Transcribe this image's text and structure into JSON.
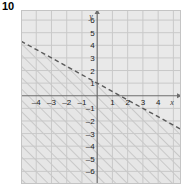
{
  "problem": {
    "number": "10"
  },
  "chart_data": {
    "type": "line",
    "title": "",
    "subtitle": "",
    "xlabel": "x",
    "ylabel": "y",
    "xlim": [
      -5,
      5.5
    ],
    "ylim": [
      -7,
      6.8
    ],
    "grid": true,
    "legend": null,
    "x_ticks": [
      -4,
      -3,
      -2,
      -1,
      1,
      2,
      3,
      4
    ],
    "y_ticks": [
      6,
      5,
      4,
      3,
      2,
      1,
      -1,
      -2,
      -3,
      -4,
      -5,
      -6
    ],
    "x_tick_labels": [
      "–4",
      "–3",
      "–2",
      "–1",
      "1",
      "2",
      "3",
      "4"
    ],
    "y_tick_labels": [
      "6",
      "5",
      "4",
      "3",
      "2",
      "1",
      "–1",
      "–2",
      "–3",
      "–4",
      "–5",
      "–6"
    ],
    "boundary_line": {
      "style": "dashed",
      "slope": -0.6666667,
      "intercept": 1,
      "y_intercept_point": [
        0,
        1
      ],
      "x_intercept_point": [
        1.5,
        0
      ],
      "equation": "y = –2/3 x + 1",
      "color": "#5a5a5a"
    },
    "shaded_region": {
      "side": "below",
      "inequality": "y < –2/3 x + 1",
      "pattern": "diagonal-hatch",
      "hatch_angle_deg": 45,
      "fill_color": "#e6e6e6",
      "hatch_color": "#b4b4b4"
    },
    "annotations": []
  },
  "style": {
    "plot_background": "#e9e9e9",
    "grid_color": "#c9c9c9",
    "axis_color": "#6e6e6e",
    "frame_color": "#bfbfbf",
    "text_color": "#1a1a1a"
  }
}
